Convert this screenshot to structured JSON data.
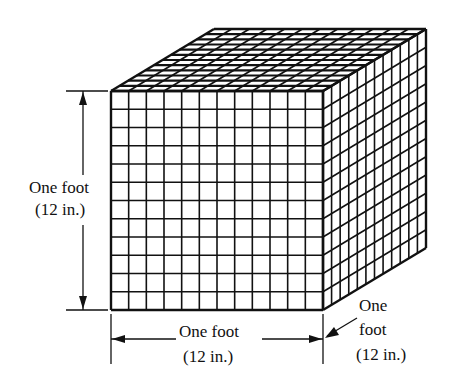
{
  "figure": {
    "type": "isometric cube diagram",
    "grid_divisions": 12,
    "line_color": "#111111",
    "background": "#ffffff"
  },
  "labels": {
    "height": {
      "line1": "One foot",
      "line2": "(12 in.)"
    },
    "width": {
      "line1": "One foot",
      "line2": "(12 in.)"
    },
    "depth": {
      "line1": "One",
      "line2": "foot",
      "line3": "(12 in.)"
    }
  }
}
